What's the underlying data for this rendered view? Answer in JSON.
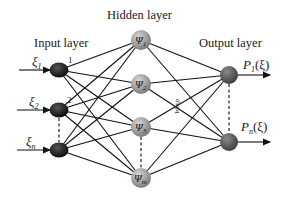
{
  "diagram": {
    "type": "neural-network",
    "layers": {
      "input": {
        "title": "Input layer",
        "nodes": [
          {
            "label": "ξ",
            "sub": "1",
            "index": "1"
          },
          {
            "label": "ξ",
            "sub": "2",
            "index": "2"
          },
          {
            "label": "ξ",
            "sub": "n",
            "index": ""
          }
        ],
        "color": "#1e1e1e"
      },
      "hidden": {
        "title": "Hidden layer",
        "nodes": [
          {
            "label": "Ψ",
            "sub": "1"
          },
          {
            "label": "Ψ",
            "sub": "2"
          },
          {
            "label": "Ψ",
            "sub": "3"
          },
          {
            "label": "Ψ",
            "sub": "m"
          }
        ],
        "color": "#8f8f8f"
      },
      "output": {
        "title": "Output layer",
        "nodes": [
          {
            "label": "P",
            "sub": "1",
            "arg": "(ξ)"
          },
          {
            "label": "P",
            "sub": "n",
            "arg": "(ξ)"
          }
        ],
        "color": "#555555"
      }
    },
    "weight_label": "Wexp"
  }
}
